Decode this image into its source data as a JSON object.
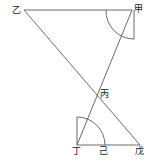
{
  "diagram": {
    "labels": {
      "yi": "乙",
      "jia": "甲",
      "bing": "丙",
      "ding": "丁",
      "ji": "己",
      "wu": "戊"
    },
    "stroke_color": "#555555"
  }
}
